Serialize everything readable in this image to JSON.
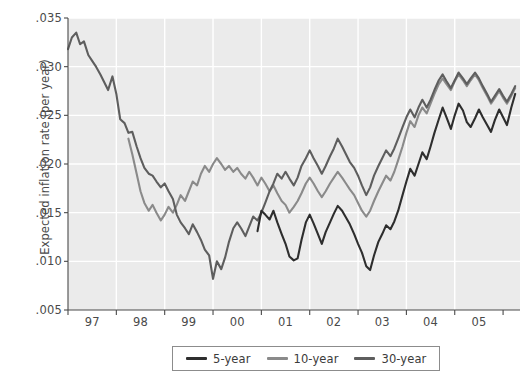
{
  "chart_data": {
    "type": "line",
    "title": "",
    "xlabel": "",
    "ylabel": "Expected inflation rate (per year)",
    "xlim": [
      1996.5,
      2005.85
    ],
    "ylim": [
      0.005,
      0.035
    ],
    "grid": true,
    "legend_position": "bottom-center",
    "ytick_labels": [
      ".035",
      ".030",
      ".025",
      ".020",
      ".015",
      ".010",
      ".005"
    ],
    "ytick_values": [
      0.035,
      0.03,
      0.025,
      0.02,
      0.015,
      0.01,
      0.005
    ],
    "xtick_labels": [
      "97",
      "98",
      "99",
      "00",
      "01",
      "02",
      "03",
      "04",
      "05"
    ],
    "xtick_values": [
      1997,
      1998,
      1999,
      2000,
      2001,
      2002,
      2003,
      2004,
      2005
    ],
    "colors": {
      "5-year": "#2e2e2e",
      "10-year": "#8a8a8a",
      "30-year": "#5e5e5e",
      "plot_background": "#ebebeb",
      "gridline": "#ffffff",
      "axis": "#4a4a4a",
      "text": "#3b3b3b"
    },
    "series": [
      {
        "name": "5-year",
        "color": "#2e2e2e",
        "x": [
          2000.42,
          2000.5,
          2000.58,
          2000.67,
          2000.75,
          2000.83,
          2000.92,
          2001.0,
          2001.08,
          2001.17,
          2001.25,
          2001.33,
          2001.42,
          2001.5,
          2001.58,
          2001.67,
          2001.75,
          2001.83,
          2001.92,
          2002.0,
          2002.08,
          2002.17,
          2002.25,
          2002.33,
          2002.42,
          2002.5,
          2002.58,
          2002.67,
          2002.75,
          2002.83,
          2002.92,
          2003.0,
          2003.08,
          2003.17,
          2003.25,
          2003.33,
          2003.42,
          2003.5,
          2003.58,
          2003.67,
          2003.75,
          2003.83,
          2003.92,
          2004.0,
          2004.08,
          2004.17,
          2004.25,
          2004.33,
          2004.42,
          2004.5,
          2004.58,
          2004.67,
          2004.75,
          2004.83,
          2004.92,
          2005.0,
          2005.08,
          2005.17,
          2005.25,
          2005.33,
          2005.42,
          2005.5,
          2005.58,
          2005.67,
          2005.75
        ],
        "y": [
          0.0131,
          0.0152,
          0.0148,
          0.0143,
          0.0152,
          0.014,
          0.0128,
          0.0118,
          0.0105,
          0.0101,
          0.0103,
          0.0122,
          0.014,
          0.0148,
          0.0139,
          0.0128,
          0.0118,
          0.013,
          0.014,
          0.0149,
          0.0157,
          0.0152,
          0.0145,
          0.0138,
          0.0128,
          0.0118,
          0.0109,
          0.0095,
          0.0091,
          0.0106,
          0.012,
          0.0128,
          0.0137,
          0.0133,
          0.0141,
          0.0152,
          0.0168,
          0.0182,
          0.0195,
          0.0188,
          0.02,
          0.0212,
          0.0205,
          0.0218,
          0.0232,
          0.0246,
          0.0258,
          0.0248,
          0.0236,
          0.025,
          0.0262,
          0.0255,
          0.0243,
          0.0238,
          0.0247,
          0.0256,
          0.0248,
          0.024,
          0.0233,
          0.0245,
          0.0256,
          0.0248,
          0.024,
          0.0258,
          0.0272
        ]
      },
      {
        "name": "10-year",
        "color": "#8a8a8a",
        "x": [
          1997.75,
          1997.83,
          1997.92,
          1998.0,
          1998.08,
          1998.17,
          1998.25,
          1998.33,
          1998.42,
          1998.5,
          1998.58,
          1998.67,
          1998.75,
          1998.83,
          1998.92,
          1999.0,
          1999.08,
          1999.17,
          1999.25,
          1999.33,
          1999.42,
          1999.5,
          1999.58,
          1999.67,
          1999.75,
          1999.83,
          1999.92,
          2000.0,
          2000.08,
          2000.17,
          2000.25,
          2000.33,
          2000.42,
          2000.5,
          2000.58,
          2000.67,
          2000.75,
          2000.83,
          2000.92,
          2001.0,
          2001.08,
          2001.17,
          2001.25,
          2001.33,
          2001.42,
          2001.5,
          2001.58,
          2001.67,
          2001.75,
          2001.83,
          2001.92,
          2002.0,
          2002.08,
          2002.17,
          2002.25,
          2002.33,
          2002.42,
          2002.5,
          2002.58,
          2002.67,
          2002.75,
          2002.83,
          2002.92,
          2003.0,
          2003.08,
          2003.17,
          2003.25,
          2003.33,
          2003.42,
          2003.5,
          2003.58,
          2003.67,
          2003.75,
          2003.83,
          2003.92,
          2004.0,
          2004.08,
          2004.17,
          2004.25,
          2004.33,
          2004.42,
          2004.5,
          2004.58,
          2004.67,
          2004.75,
          2004.83,
          2004.92,
          2005.0,
          2005.08,
          2005.17,
          2005.25,
          2005.33,
          2005.42,
          2005.5,
          2005.58,
          2005.67,
          2005.75
        ],
        "y": [
          0.0226,
          0.021,
          0.019,
          0.0172,
          0.016,
          0.0152,
          0.0158,
          0.015,
          0.0142,
          0.0148,
          0.0156,
          0.015,
          0.0158,
          0.0168,
          0.0162,
          0.0172,
          0.0182,
          0.0178,
          0.019,
          0.0198,
          0.0192,
          0.02,
          0.0206,
          0.02,
          0.0194,
          0.0198,
          0.0192,
          0.0196,
          0.019,
          0.0185,
          0.0192,
          0.0186,
          0.0178,
          0.0186,
          0.018,
          0.0172,
          0.0178,
          0.017,
          0.0162,
          0.0158,
          0.015,
          0.0156,
          0.0162,
          0.017,
          0.018,
          0.0186,
          0.018,
          0.0172,
          0.0166,
          0.0172,
          0.018,
          0.0186,
          0.0192,
          0.0186,
          0.018,
          0.0174,
          0.0168,
          0.016,
          0.0152,
          0.0146,
          0.0152,
          0.0162,
          0.0172,
          0.018,
          0.0188,
          0.0183,
          0.0192,
          0.0204,
          0.0218,
          0.0232,
          0.0244,
          0.0238,
          0.025,
          0.0258,
          0.0252,
          0.0262,
          0.0272,
          0.0282,
          0.0288,
          0.0282,
          0.0276,
          0.0285,
          0.0292,
          0.0286,
          0.028,
          0.0286,
          0.0292,
          0.0286,
          0.0278,
          0.027,
          0.0262,
          0.0268,
          0.0275,
          0.0268,
          0.0262,
          0.027,
          0.0278
        ]
      },
      {
        "name": "30-year",
        "color": "#5e5e5e",
        "x": [
          1996.5,
          1996.58,
          1996.67,
          1996.75,
          1996.83,
          1996.92,
          1997.0,
          1997.08,
          1997.17,
          1997.25,
          1997.33,
          1997.42,
          1997.5,
          1997.58,
          1997.67,
          1997.75,
          1997.83,
          1997.92,
          1998.0,
          1998.08,
          1998.17,
          1998.25,
          1998.33,
          1998.42,
          1998.5,
          1998.58,
          1998.67,
          1998.75,
          1998.83,
          1998.92,
          1999.0,
          1999.08,
          1999.17,
          1999.25,
          1999.33,
          1999.42,
          1999.5,
          1999.58,
          1999.67,
          1999.75,
          1999.83,
          1999.92,
          2000.0,
          2000.08,
          2000.17,
          2000.25,
          2000.33,
          2000.42,
          2000.5,
          2000.58,
          2000.67,
          2000.75,
          2000.83,
          2000.92,
          2001.0,
          2001.08,
          2001.17,
          2001.25,
          2001.33,
          2001.42,
          2001.5,
          2001.58,
          2001.67,
          2001.75,
          2001.83,
          2001.92,
          2002.0,
          2002.08,
          2002.17,
          2002.25,
          2002.33,
          2002.42,
          2002.5,
          2002.58,
          2002.67,
          2002.75,
          2002.83,
          2002.92,
          2003.0,
          2003.08,
          2003.17,
          2003.25,
          2003.33,
          2003.42,
          2003.5,
          2003.58,
          2003.67,
          2003.75,
          2003.83,
          2003.92,
          2004.0,
          2004.08,
          2004.17,
          2004.25,
          2004.33,
          2004.42,
          2004.5,
          2004.58,
          2004.67,
          2004.75,
          2004.83,
          2004.92,
          2005.0,
          2005.08,
          2005.17,
          2005.25,
          2005.33,
          2005.42,
          2005.5,
          2005.58,
          2005.67,
          2005.75
        ],
        "y": [
          0.0318,
          0.033,
          0.0335,
          0.0323,
          0.0326,
          0.0312,
          0.0306,
          0.03,
          0.0292,
          0.0284,
          0.0276,
          0.029,
          0.0272,
          0.0246,
          0.0242,
          0.0232,
          0.0233,
          0.0218,
          0.0206,
          0.0196,
          0.019,
          0.0188,
          0.0182,
          0.0176,
          0.018,
          0.0172,
          0.0164,
          0.0148,
          0.014,
          0.0134,
          0.0128,
          0.0138,
          0.013,
          0.0122,
          0.0112,
          0.0106,
          0.0082,
          0.01,
          0.0092,
          0.0104,
          0.012,
          0.0134,
          0.014,
          0.0134,
          0.0126,
          0.0136,
          0.0146,
          0.0142,
          0.015,
          0.016,
          0.0172,
          0.018,
          0.019,
          0.0185,
          0.0192,
          0.0185,
          0.0178,
          0.0186,
          0.0198,
          0.0206,
          0.0214,
          0.0206,
          0.0198,
          0.019,
          0.0198,
          0.0208,
          0.0216,
          0.0226,
          0.0218,
          0.021,
          0.0202,
          0.0196,
          0.0188,
          0.0178,
          0.0168,
          0.0176,
          0.0188,
          0.0198,
          0.0206,
          0.0214,
          0.0208,
          0.0216,
          0.0226,
          0.0238,
          0.0248,
          0.0256,
          0.0248,
          0.0258,
          0.0266,
          0.0258,
          0.0266,
          0.0276,
          0.0286,
          0.0292,
          0.0285,
          0.0278,
          0.0286,
          0.0294,
          0.0288,
          0.0282,
          0.0288,
          0.0294,
          0.0288,
          0.028,
          0.0272,
          0.0264,
          0.027,
          0.0277,
          0.027,
          0.0264,
          0.0272,
          0.028
        ]
      }
    ]
  },
  "legend": {
    "items": [
      {
        "label": "5-year",
        "color": "#2e2e2e"
      },
      {
        "label": "10-year",
        "color": "#8a8a8a"
      },
      {
        "label": "30-year",
        "color": "#5e5e5e"
      }
    ]
  }
}
